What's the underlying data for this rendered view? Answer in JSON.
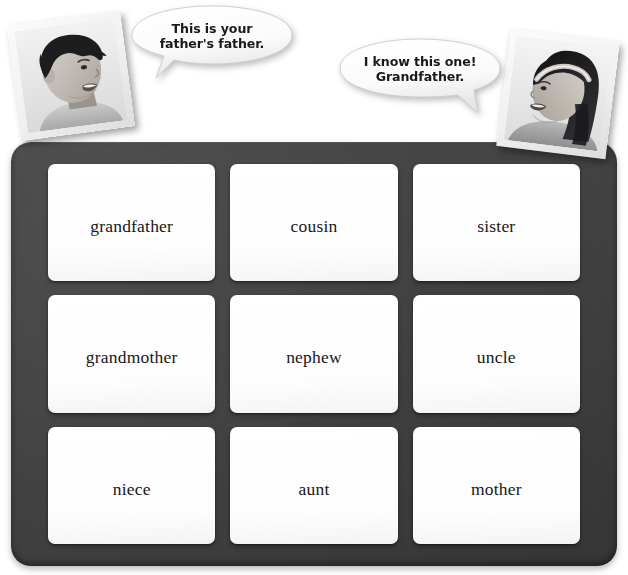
{
  "scene": {
    "title": "Family vocabulary card board",
    "background_color": "#ffffff",
    "board_color": "#444444",
    "card_color": "#ffffff",
    "text_color": "#17171a"
  },
  "speech_bubbles": [
    {
      "speaker": "boy",
      "line1": "This is your",
      "line2": "father's father.",
      "tail": "down-left"
    },
    {
      "speaker": "girl",
      "line1": "I know this one!",
      "line2": "Grandfather.",
      "tail": "down-right"
    }
  ],
  "photos": [
    {
      "name": "boy-photo",
      "alt": "Smiling boy facing right"
    },
    {
      "name": "girl-photo",
      "alt": "Smiling girl with headband facing left"
    }
  ],
  "board": {
    "rows": 3,
    "columns": 3,
    "cards": [
      {
        "label": "grandfather",
        "row": 1,
        "col": 1
      },
      {
        "label": "cousin",
        "row": 1,
        "col": 2
      },
      {
        "label": "sister",
        "row": 1,
        "col": 3
      },
      {
        "label": "grandmother",
        "row": 2,
        "col": 1
      },
      {
        "label": "nephew",
        "row": 2,
        "col": 2
      },
      {
        "label": "uncle",
        "row": 2,
        "col": 3
      },
      {
        "label": "niece",
        "row": 3,
        "col": 1
      },
      {
        "label": "aunt",
        "row": 3,
        "col": 2
      },
      {
        "label": "mother",
        "row": 3,
        "col": 3
      }
    ]
  }
}
